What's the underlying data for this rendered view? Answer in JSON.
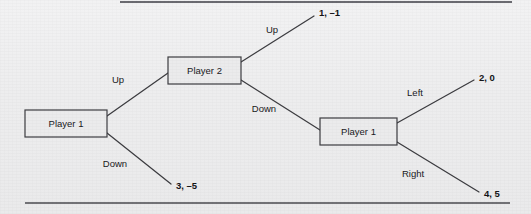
{
  "figure": {
    "background_color": "#efeff0",
    "line_color": "#3c3c40",
    "box_fill": "#ebebec",
    "box_border": "#3d3d42",
    "text_color": "#19191c"
  },
  "rules": {
    "top": {
      "x1": 120,
      "y1": 2,
      "x2": 512,
      "y2": 2
    },
    "bottom": {
      "x1": 25,
      "y1": 203,
      "x2": 510,
      "y2": 203
    }
  },
  "nodes": [
    {
      "id": "root",
      "label": "Player 1",
      "x": 25,
      "y": 110,
      "w": 82,
      "h": 27
    },
    {
      "id": "p2",
      "label": "Player 2",
      "x": 168,
      "y": 57,
      "w": 73,
      "h": 27
    },
    {
      "id": "p1b",
      "label": "Player 1",
      "x": 320,
      "y": 118,
      "w": 77,
      "h": 27
    }
  ],
  "edges": [
    {
      "id": "root-up",
      "from": "root",
      "to": "p2",
      "action": "Up",
      "label_x": 118,
      "label_y": 80,
      "x1": 107,
      "y1": 116,
      "x2": 168,
      "y2": 73
    },
    {
      "id": "root-down",
      "from": "root",
      "to": "payoff-3-5",
      "action": "Down",
      "label_x": 115,
      "label_y": 164,
      "x1": 107,
      "y1": 133,
      "x2": 171,
      "y2": 184
    },
    {
      "id": "p2-up",
      "from": "p2",
      "to": "payoff-1-m1",
      "action": "Up",
      "label_x": 272,
      "label_y": 30,
      "x1": 241,
      "y1": 62,
      "x2": 314,
      "y2": 16
    },
    {
      "id": "p2-down",
      "from": "p2",
      "to": "p1b",
      "action": "Down",
      "label_x": 264,
      "label_y": 109,
      "x1": 241,
      "y1": 80,
      "x2": 320,
      "y2": 130
    },
    {
      "id": "p1b-left",
      "from": "p1b",
      "to": "payoff-2-0",
      "action": "Left",
      "label_x": 415,
      "label_y": 93,
      "x1": 397,
      "y1": 123,
      "x2": 474,
      "y2": 80
    },
    {
      "id": "p1b-right",
      "from": "p1b",
      "to": "payoff-4-5",
      "action": "Right",
      "label_x": 413,
      "label_y": 174,
      "x1": 397,
      "y1": 142,
      "x2": 479,
      "y2": 192
    }
  ],
  "payoffs": [
    {
      "id": "payoff-1-m1",
      "text": "1, –1",
      "x": 319,
      "y": 13
    },
    {
      "id": "payoff-3-5",
      "text": "3, –5",
      "x": 176,
      "y": 186
    },
    {
      "id": "payoff-2-0",
      "text": "2, 0",
      "x": 479,
      "y": 78
    },
    {
      "id": "payoff-4-5",
      "text": "4, 5",
      "x": 484,
      "y": 194
    }
  ]
}
